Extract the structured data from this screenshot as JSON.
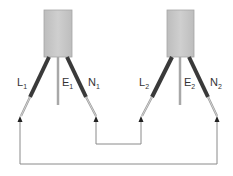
{
  "diagram": {
    "colors": {
      "box_fill": "#c8c8c8",
      "box_edge": "#9a9a9a",
      "wire_dark": "#3a3a3a",
      "wire_light": "#b0b0b0",
      "circuit_line": "#8a8a8a"
    },
    "devices": [
      {
        "id": "device-1",
        "labels": {
          "L": "L",
          "L_sub": "1",
          "E": "E",
          "E_sub": "1",
          "N": "N",
          "N_sub": "1"
        }
      },
      {
        "id": "device-2",
        "labels": {
          "L": "L",
          "L_sub": "2",
          "E": "E",
          "E_sub": "2",
          "N": "N",
          "N_sub": "2"
        }
      }
    ],
    "connections": [
      {
        "from": "N1",
        "to": "L2",
        "description": "series link"
      },
      {
        "from": "L1",
        "to": "N2",
        "description": "return loop"
      }
    ]
  }
}
